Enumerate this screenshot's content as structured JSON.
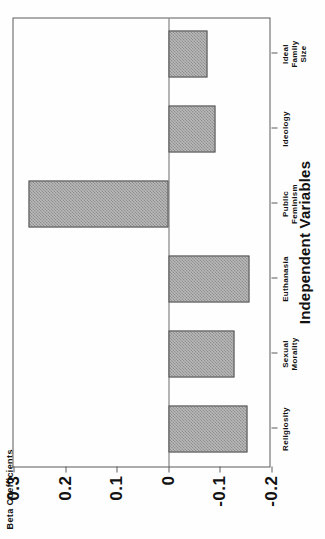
{
  "chart_data": {
    "type": "bar",
    "title": "",
    "xlabel": "Independent Variables",
    "ylabel": "Beta Coefficients",
    "categories": [
      "Religiosity",
      "Sexual Morality",
      "Euthanasia",
      "Public Feminism",
      "Ideology",
      "Ideal Family Size"
    ],
    "values": [
      -0.153,
      -0.129,
      -0.157,
      0.271,
      -0.092,
      -0.076
    ],
    "ylim": [
      -0.2,
      0.3
    ],
    "yticks": [
      0.3,
      0.2,
      0.1,
      0,
      -0.1,
      -0.2
    ],
    "ytick_labels": [
      "0.3",
      "0.2",
      "0.1",
      "0",
      "-0.1",
      "-0.2"
    ],
    "grid": false,
    "legend": false,
    "orientation": "vertical",
    "bar_fill": "#b9b9b9",
    "bar_hatch": "crosshatch",
    "bar_edge_color": "#4a4a4a",
    "axis_color": "#5a5a5a",
    "background": "#fefefe",
    "rotation_deg": -90
  },
  "axis": {
    "y_title": "Beta Coefficients",
    "x_title": "Independent Variables"
  },
  "categories": [
    {
      "label": "Religiosity",
      "value": -0.153
    },
    {
      "label": "Sexual\nMorality",
      "value": -0.129
    },
    {
      "label": "Euthanasia",
      "value": -0.157
    },
    {
      "label": "Public\nFeminism",
      "value": 0.271
    },
    {
      "label": "Ideology",
      "value": -0.092
    },
    {
      "label": "Ideal\nFamily\nSize",
      "value": -0.076
    }
  ],
  "yticks": [
    {
      "label": "0.3",
      "value": 0.3
    },
    {
      "label": "0.2",
      "value": 0.2
    },
    {
      "label": "0.1",
      "value": 0.1
    },
    {
      "label": "0",
      "value": 0
    },
    {
      "label": "-0.1",
      "value": -0.1
    },
    {
      "label": "-0.2",
      "value": -0.2
    }
  ]
}
